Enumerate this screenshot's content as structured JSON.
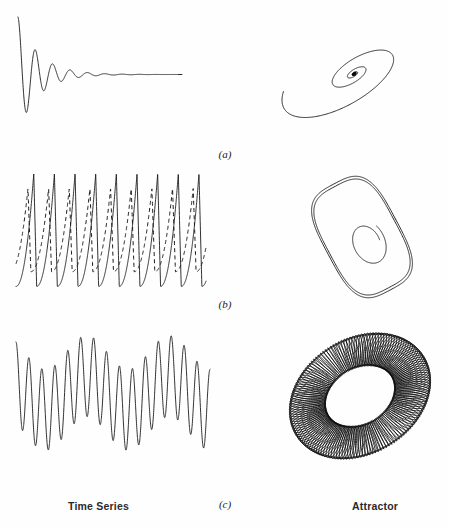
{
  "figure": {
    "column_labels": {
      "left": "Time Series",
      "right": "Attractor"
    },
    "panels": [
      {
        "id": "a",
        "label": "(a)",
        "time_series_name": "damped-oscillation",
        "attractor_name": "spiral-fixed-point"
      },
      {
        "id": "b",
        "label": "(b)",
        "time_series_name": "periodic-relaxation-oscillation",
        "attractor_name": "limit-cycle"
      },
      {
        "id": "c",
        "label": "(c)",
        "time_series_name": "quasiperiodic-beats",
        "attractor_name": "torus"
      }
    ]
  },
  "chart_data": [
    {
      "type": "line",
      "id": "a-time-series",
      "title": "Damped oscillation time series",
      "xlabel": "",
      "ylabel": "",
      "grid": false,
      "legend": "none",
      "xlim": [
        0,
        1
      ],
      "ylim": [
        -1.05,
        1.05
      ],
      "description": "Exponentially damped sinusoid decaying to a constant zero level",
      "model": {
        "form": "y = exp(-decay*t) * cos(2*pi*freq*t)",
        "decay": 7.8,
        "freq": 9.2,
        "t_start": 0.0,
        "t_end": 1.0,
        "samples": 900
      }
    },
    {
      "type": "line",
      "id": "a-attractor",
      "title": "Spiral to a fixed point",
      "xlabel": "",
      "ylabel": "",
      "grid": false,
      "legend": "none",
      "description": "Inward logarithmic spiral on a tilted ellipse converging to a dense point attractor",
      "model": {
        "form": "r = r0*exp(-b*theta), elliptical with tilt",
        "r0": 1.0,
        "b": 0.19,
        "turns": 4.6,
        "aspect": 0.42,
        "tilt_deg": -31,
        "samples": 1400
      }
    },
    {
      "type": "line",
      "id": "b-time-series",
      "series": [
        {
          "name": "solid-trace",
          "style": "solid",
          "amplitude": 1.0,
          "cycles": 9.2,
          "phase": 0.0,
          "waveform": "relaxation-spike: slow rise, sharp fall"
        },
        {
          "name": "dashed-trace",
          "style": "dashed",
          "amplitude": 0.74,
          "cycles": 9.2,
          "phase": 0.28,
          "waveform": "relaxation-spike: slow rise, sharp fall"
        }
      ],
      "title": "Periodic relaxation oscillation time series",
      "xlabel": "",
      "ylabel": "",
      "grid": false,
      "legend": "none",
      "xlim": [
        0,
        1
      ],
      "ylim": [
        -1.1,
        1.1
      ]
    },
    {
      "type": "line",
      "id": "b-attractor",
      "title": "Limit cycle",
      "xlabel": "",
      "ylabel": "",
      "grid": false,
      "legend": "none",
      "description": "Closed rounded-rectangle limit cycle, traced twice, with an inner transient spiral tail",
      "model": {
        "outer_loops": 2,
        "corner_radius": 0.38,
        "tilt_deg": -28,
        "inner_spiral_turns": 1.1
      }
    },
    {
      "type": "line",
      "id": "c-time-series",
      "title": "Quasi-periodic time series",
      "xlabel": "",
      "ylabel": "",
      "grid": false,
      "legend": "none",
      "xlim": [
        0,
        1
      ],
      "ylim": [
        -1.05,
        1.05
      ],
      "description": "Sum of two incommensurate frequencies producing amplitude-modulated beats",
      "model": {
        "form": "y = a1*cos(2*pi*f1*t) + a2*cos(2*pi*f2*t + p)",
        "f1": 15.0,
        "a1": 0.72,
        "f2": 2.35,
        "a2": 0.3,
        "p": 0.9,
        "samples": 1600
      }
    },
    {
      "type": "line",
      "id": "c-attractor",
      "title": "Torus attractor",
      "xlabel": "",
      "ylabel": "",
      "grid": false,
      "legend": "none",
      "description": "Dense quasi-periodic winding filling an annulus (2-torus) projected as a tilted ellipse ring",
      "model": {
        "major_radius": 1.0,
        "minor_radius": 0.33,
        "winding_ratio": 17.35,
        "windings": 150,
        "aspect": 0.76,
        "tilt_deg": -32
      }
    }
  ]
}
